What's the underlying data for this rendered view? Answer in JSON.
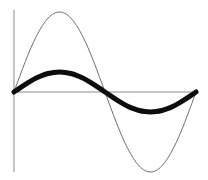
{
  "figure": {
    "background_color": "#ffffff",
    "width": 208,
    "height": 180
  },
  "axes": {
    "origin_x": 14,
    "origin_y": 92,
    "x_axis": {
      "name": "horizontal-axis",
      "x1": 14,
      "y1": 92,
      "x2": 195,
      "y2": 92,
      "color": "#8a8a8a",
      "width": 1
    },
    "y_axis": {
      "name": "vertical-axis",
      "x1": 14,
      "y1": 10,
      "x2": 14,
      "y2": 172,
      "color": "#8a8a8a",
      "width": 1
    }
  },
  "chart_data": {
    "type": "line",
    "xlabel": "",
    "ylabel": "",
    "grid": false,
    "legend": "none",
    "xlim": [
      0,
      6.28318
    ],
    "ylim": [
      -1.05,
      1.05
    ],
    "x": [
      0.0,
      0.19635,
      0.3927,
      0.58905,
      0.7854,
      0.98175,
      1.1781,
      1.37445,
      1.5708,
      1.76715,
      1.9635,
      2.15985,
      2.35619,
      2.55254,
      2.74889,
      2.94524,
      3.14159,
      3.33794,
      3.53429,
      3.73064,
      3.92699,
      4.12334,
      4.31969,
      4.51604,
      4.71239,
      4.90874,
      5.10509,
      5.30144,
      5.49779,
      5.69414,
      5.89049,
      6.08684,
      6.28318
    ],
    "series": [
      {
        "name": "large-amplitude-sine",
        "style": "thin",
        "color": "#6e6e6e",
        "stroke_width": 1,
        "amplitude": 1.0,
        "amplitude_px": 80,
        "period_px": 182,
        "peak_px": {
          "x": 60,
          "y": 12
        },
        "trough_px": {
          "x": 151,
          "y": 171
        },
        "values": [
          0.0,
          0.195,
          0.383,
          0.556,
          0.707,
          0.831,
          0.924,
          0.981,
          1.0,
          0.981,
          0.924,
          0.831,
          0.707,
          0.556,
          0.383,
          0.195,
          0.0,
          -0.195,
          -0.383,
          -0.556,
          -0.707,
          -0.831,
          -0.924,
          -0.981,
          -1.0,
          -0.981,
          -0.924,
          -0.831,
          -0.707,
          -0.556,
          -0.383,
          -0.195,
          0.0
        ]
      },
      {
        "name": "small-amplitude-sine",
        "style": "bold",
        "color": "#0d0d0d",
        "stroke_width": 5,
        "amplitude": 0.5,
        "amplitude_px": 40,
        "period_px": 182,
        "peak_px": {
          "x": 62,
          "y": 52
        },
        "trough_px": {
          "x": 150,
          "y": 130
        },
        "values": [
          0.0,
          0.098,
          0.191,
          0.278,
          0.354,
          0.416,
          0.462,
          0.49,
          0.5,
          0.49,
          0.462,
          0.416,
          0.354,
          0.278,
          0.191,
          0.098,
          0.0,
          -0.098,
          -0.191,
          -0.278,
          -0.354,
          -0.416,
          -0.462,
          -0.49,
          -0.5,
          -0.49,
          -0.462,
          -0.416,
          -0.354,
          -0.278,
          -0.191,
          -0.098,
          0.0
        ]
      }
    ],
    "zero_crossing_px": {
      "x": 105,
      "y": 92
    },
    "curve_end_px": {
      "x": 199,
      "y": 85
    }
  }
}
